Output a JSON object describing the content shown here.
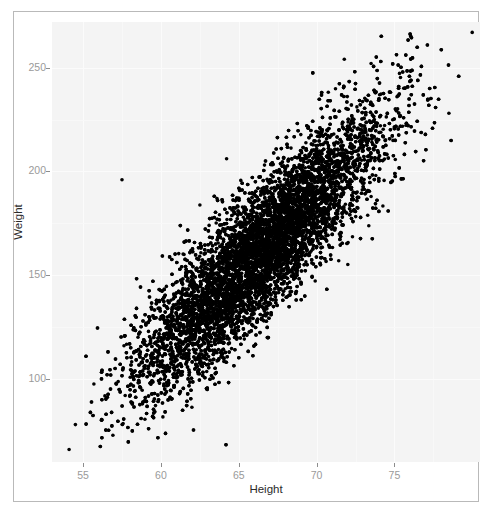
{
  "chart_data": {
    "type": "scatter",
    "title": "",
    "xlabel": "Height",
    "ylabel": "Weight",
    "xlim": [
      53.0,
      80.5
    ],
    "ylim": [
      60,
      272
    ],
    "xticks": [
      55,
      60,
      65,
      70,
      75
    ],
    "yticks": [
      100,
      150,
      200,
      250
    ],
    "grid": true,
    "legend": null,
    "n_points": 10000,
    "marker": {
      "shape": "circle",
      "color": "#000000",
      "size_px": 3.6
    },
    "panel_background": "#f4f4f4",
    "gridline_color": "#fbfbfb",
    "tick_label_color": "#9a9a9a",
    "axis_title_color": "#2b2b2b",
    "correlation": 0.87,
    "x_mean": 66.4,
    "y_mean": 161.5,
    "x_sd": 3.85,
    "y_sd": 32.5,
    "series": [
      {
        "name": "observations",
        "x_range": [
          54.0,
          80.2
        ],
        "y_range": [
          64.0,
          267.0
        ],
        "trend_slope": 7.35,
        "trend_intercept": -326.5
      }
    ],
    "notable_points": [
      {
        "x": 80.0,
        "y": 267.0,
        "note": "top-right extreme outlier"
      },
      {
        "x": 54.1,
        "y": 66.0,
        "note": "bottom-left extreme outlier"
      },
      {
        "x": 78.5,
        "y": 228.0,
        "note": "right edge"
      },
      {
        "x": 57.5,
        "y": 196.0,
        "note": "upper-left sparse point"
      },
      {
        "x": 73.5,
        "y": 252.0,
        "note": "upper-right cluster edge"
      }
    ]
  },
  "axes": {
    "x": {
      "title": "Height",
      "tick_labels": [
        "55",
        "60",
        "65",
        "70",
        "75"
      ]
    },
    "y": {
      "title": "Weight",
      "tick_labels": [
        "100",
        "150",
        "200",
        "250"
      ]
    }
  }
}
